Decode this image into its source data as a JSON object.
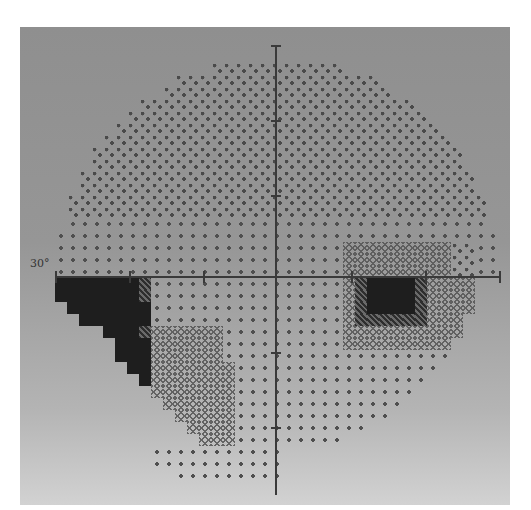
{
  "figure": {
    "type": "visual-field-greyscale",
    "eccentricity_label": "30°"
  },
  "chart_data": {
    "type": "heatmap",
    "title": "",
    "xlabel": "",
    "ylabel": "",
    "axis_range_deg": [
      -30,
      30
    ],
    "tick_step_deg": 10,
    "tick_labels": [
      "30°"
    ],
    "grid": false,
    "legend": "none",
    "levels": {
      "0": "normal (sparse dots)",
      "1": "mildly reduced (dense dots)",
      "2": "moderately reduced (light crosshatch)",
      "3": "markedly reduced (dark crosshatch)",
      "4": "absolute defect (solid black)"
    },
    "regions": [
      {
        "name": "inferior-nasal stepped defect",
        "quadrant": "lower-left",
        "level": 4
      },
      {
        "name": "inferior arcuate band",
        "quadrant": "lower-left to center",
        "level": 2
      },
      {
        "name": "physiologic blind spot",
        "location": "~15° temporal, just below horizontal",
        "level": 4
      },
      {
        "name": "peri-blind-spot depression",
        "location": "right of center",
        "level": 2
      },
      {
        "name": "superior mild depression",
        "quadrant": "upper",
        "level": 1
      }
    ]
  },
  "colors": {
    "panel_top": "#8f8f8f",
    "panel_bottom": "#d2d2d2",
    "axis": "#3a3a3a",
    "defect": "#1e1e1e"
  }
}
